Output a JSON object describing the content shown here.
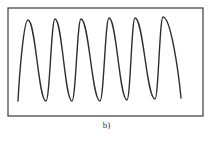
{
  "figure": {
    "caption": "b)",
    "frame": {
      "x": 8,
      "y": 8,
      "width": 195,
      "height": 108,
      "stroke": "#3a3a3a",
      "stroke_width": 1.2
    },
    "wave": {
      "stroke": "#2e2e2e",
      "stroke_width": 1.4,
      "description": "asymmetric periodic waveform, 6 peaks, steep rise / slower fall",
      "start": [
        18,
        101
      ],
      "end": [
        181,
        98
      ],
      "peaks": [
        [
          28,
          20
        ],
        [
          55,
          19
        ],
        [
          81,
          19
        ],
        [
          109,
          18
        ],
        [
          135,
          18
        ],
        [
          163,
          17
        ]
      ],
      "troughs": [
        [
          46,
          101
        ],
        [
          72,
          101
        ],
        [
          100,
          101
        ],
        [
          127,
          100
        ],
        [
          155,
          99
        ]
      ]
    }
  }
}
